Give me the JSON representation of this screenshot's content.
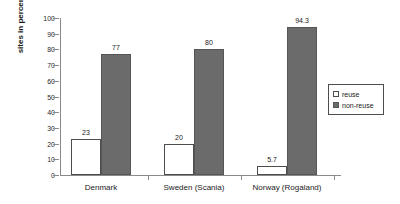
{
  "chart_data": {
    "type": "bar",
    "title": "",
    "xlabel": "",
    "ylabel": "sites in percent",
    "ylim": [
      0,
      100
    ],
    "ytick_step": 10,
    "yticks": [
      100,
      90,
      80,
      70,
      60,
      50,
      40,
      30,
      20,
      10,
      0
    ],
    "grid": false,
    "legend_position": "right",
    "categories": [
      "Denmark",
      "Sweden (Scania)",
      "Norway (Rogaland)"
    ],
    "series": [
      {
        "name": "reuse",
        "color": "#ffffff",
        "values": [
          23,
          20,
          5.7
        ],
        "labels": [
          "23",
          "20",
          "5.7"
        ]
      },
      {
        "name": "non-reuse",
        "color": "#6b6b6b",
        "values": [
          77,
          80,
          94.3
        ],
        "labels": [
          "77",
          "80",
          "94.3"
        ]
      }
    ]
  },
  "legend": {
    "items": [
      {
        "label": "reuse"
      },
      {
        "label": "non-reuse"
      }
    ]
  }
}
